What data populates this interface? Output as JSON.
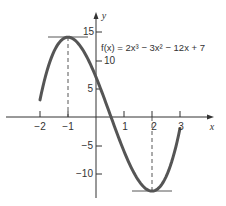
{
  "chart_data": {
    "type": "line",
    "title": "",
    "function": "f(x) = 2x^3 - 3x^2 - 12x + 7",
    "xlabel": "x",
    "ylabel": "y",
    "xlim": [
      -2,
      3
    ],
    "ylim": [
      -13,
      15
    ],
    "x_ticks": [
      -2,
      -1,
      1,
      2,
      3
    ],
    "y_ticks": [
      15,
      10,
      5,
      -5,
      -10
    ],
    "x": [
      -2,
      -1.5,
      -1,
      -0.5,
      0,
      0.5,
      1,
      1.5,
      2,
      2.5,
      3
    ],
    "series": [
      {
        "name": "f(x)",
        "values": [
          3,
          11,
          14,
          12.5,
          7,
          0,
          -6,
          -11,
          -13,
          -10.5,
          -2
        ]
      }
    ],
    "annotations": [
      {
        "type": "local-max",
        "x": -1,
        "y": 14,
        "style": "horizontal tangent + dashed drop line"
      },
      {
        "type": "local-min",
        "x": 2,
        "y": -13,
        "style": "horizontal tangent + dashed drop line"
      },
      {
        "type": "label",
        "text": "f(x) = 2x³ − 3x² − 12x + 7"
      }
    ],
    "grid": false,
    "legend": "none"
  },
  "labels": {
    "x_axis": "x",
    "y_axis": "y",
    "formula": "f(x) = 2x³ − 3x² − 12x + 7",
    "xt_m2": "−2",
    "xt_m1": "−1",
    "xt_1": "1",
    "xt_2": "2",
    "xt_3": "3",
    "yt_15": "15",
    "yt_10": "10",
    "yt_5": "5",
    "yt_m5": "−5",
    "yt_m10": "−10"
  },
  "colors": {
    "curve": "#555555",
    "axis": "#333333"
  }
}
